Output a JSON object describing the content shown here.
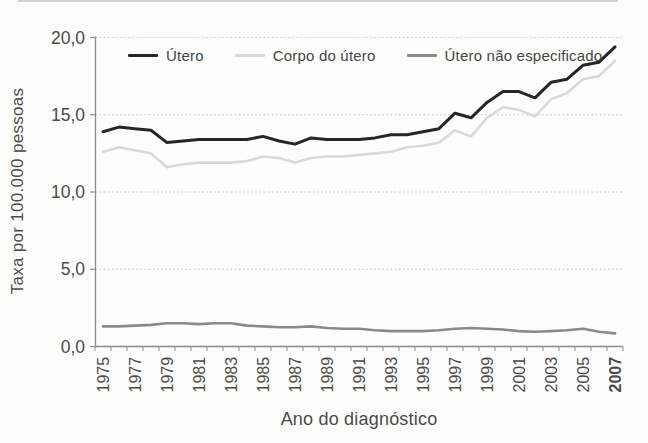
{
  "chart_data": {
    "type": "line",
    "title": "",
    "xlabel": "Ano do diagnóstico",
    "ylabel": "Taxa por 100.000 pessoas",
    "x": [
      1975,
      1976,
      1977,
      1978,
      1979,
      1980,
      1981,
      1982,
      1983,
      1984,
      1985,
      1986,
      1987,
      1988,
      1989,
      1990,
      1991,
      1992,
      1993,
      1994,
      1995,
      1996,
      1997,
      1998,
      1999,
      2000,
      2001,
      2002,
      2003,
      2004,
      2005,
      2006,
      2007
    ],
    "x_tick_labels": [
      "1975",
      "1977",
      "1979",
      "1981",
      "1983",
      "1985",
      "1987",
      "1989",
      "1991",
      "1993",
      "1995",
      "1997",
      "1999",
      "2001",
      "2003",
      "2005",
      "2007"
    ],
    "x_tick_bold": "2007",
    "y_ticks": [
      {
        "label": "20,0",
        "value": 20
      },
      {
        "label": "15,0",
        "value": 15
      },
      {
        "label": "10,0",
        "value": 10
      },
      {
        "label": "5,0",
        "value": 5
      },
      {
        "label": "0,0",
        "value": 0
      }
    ],
    "ylim": [
      0,
      20
    ],
    "grid": "horizontal-dotted",
    "legend_position": "top-inside",
    "series": [
      {
        "name": "Útero",
        "color": "#262626",
        "stroke_width": 3,
        "values": [
          13.9,
          14.2,
          14.1,
          14.0,
          13.2,
          13.3,
          13.4,
          13.4,
          13.4,
          13.4,
          13.6,
          13.3,
          13.1,
          13.5,
          13.4,
          13.4,
          13.4,
          13.5,
          13.7,
          13.7,
          13.9,
          14.1,
          15.1,
          14.8,
          15.8,
          16.5,
          16.5,
          16.1,
          17.1,
          17.3,
          18.2,
          18.4,
          19.4
        ]
      },
      {
        "name": "Corpo do útero",
        "color": "#d9d9d9",
        "stroke_width": 2.6,
        "values": [
          12.6,
          12.9,
          12.7,
          12.5,
          11.6,
          11.8,
          11.9,
          11.9,
          11.9,
          12.0,
          12.3,
          12.2,
          11.9,
          12.2,
          12.3,
          12.3,
          12.4,
          12.5,
          12.6,
          12.9,
          13.0,
          13.2,
          14.0,
          13.6,
          14.8,
          15.5,
          15.3,
          14.9,
          16.0,
          16.4,
          17.3,
          17.5,
          18.5
        ]
      },
      {
        "name": "Útero não especificado",
        "color": "#8a8a8a",
        "stroke_width": 2.6,
        "values": [
          1.3,
          1.3,
          1.35,
          1.4,
          1.5,
          1.5,
          1.45,
          1.5,
          1.5,
          1.35,
          1.3,
          1.25,
          1.25,
          1.3,
          1.2,
          1.15,
          1.15,
          1.05,
          1.0,
          1.0,
          1.0,
          1.05,
          1.15,
          1.2,
          1.15,
          1.1,
          1.0,
          0.95,
          1.0,
          1.05,
          1.15,
          0.95,
          0.85
        ]
      }
    ],
    "axis_color": "#8c8c8c",
    "grid_color": "#c2c2c2",
    "tick_label_color": "#4a4a4a"
  }
}
